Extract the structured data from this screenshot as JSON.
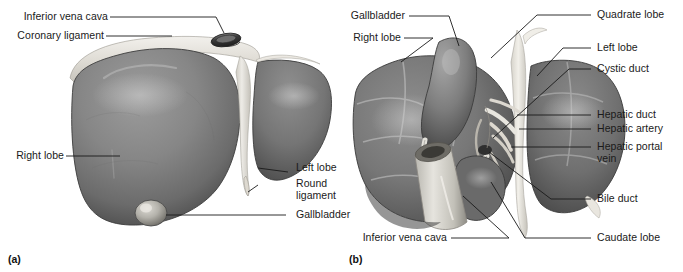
{
  "figure": {
    "background_color": "#ffffff",
    "label_color": "#1a1a1a",
    "leader_color": "#1a1a1a",
    "liver_tone_mid": "#8a8a8a",
    "liver_tone_dark": "#555555",
    "liver_tone_darker": "#3f3f3f",
    "ligament_tone": "#e8e6e1",
    "vessel_tone": "#cfcdc6"
  },
  "panels": [
    {
      "id": "a",
      "caption": "(a)",
      "view": "anterior",
      "labels": [
        {
          "id": "a-ivc",
          "text": "Inferior vena cava",
          "align": "right"
        },
        {
          "id": "a-coronary",
          "text": "Coronary ligament",
          "align": "right"
        },
        {
          "id": "a-right-lobe",
          "text": "Right lobe",
          "align": "right"
        },
        {
          "id": "a-left-lobe",
          "text": "Left lobe",
          "align": "left"
        },
        {
          "id": "a-round-lig",
          "text": "Round ligament",
          "align": "left"
        },
        {
          "id": "a-gallbladder",
          "text": "Gallbladder",
          "align": "left"
        }
      ]
    },
    {
      "id": "b",
      "caption": "(b)",
      "view": "inferior",
      "labels": [
        {
          "id": "b-gallbladder",
          "text": "Gallbladder",
          "align": "right"
        },
        {
          "id": "b-right-lobe",
          "text": "Right lobe",
          "align": "right"
        },
        {
          "id": "b-ivc",
          "text": "Inferior vena cava",
          "align": "right"
        },
        {
          "id": "b-quadrate",
          "text": "Quadrate lobe",
          "align": "left"
        },
        {
          "id": "b-left-lobe",
          "text": "Left lobe",
          "align": "left"
        },
        {
          "id": "b-cystic",
          "text": "Cystic duct",
          "align": "left"
        },
        {
          "id": "b-hep-duct",
          "text": "Hepatic duct",
          "align": "left"
        },
        {
          "id": "b-hep-artery",
          "text": "Hepatic artery",
          "align": "left"
        },
        {
          "id": "b-hep-portal",
          "text": "Hepatic portal vein",
          "align": "left"
        },
        {
          "id": "b-bile-duct",
          "text": "Bile duct",
          "align": "left"
        },
        {
          "id": "b-caudate",
          "text": "Caudate lobe",
          "align": "left"
        }
      ]
    }
  ]
}
